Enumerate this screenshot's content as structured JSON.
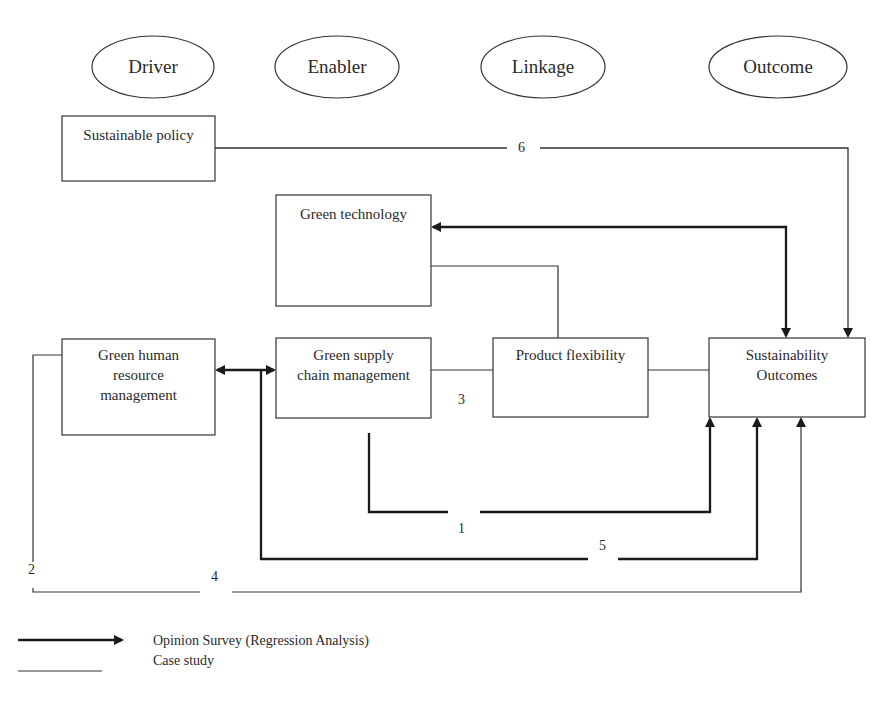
{
  "headers": [
    {
      "id": "driver",
      "label": "Driver"
    },
    {
      "id": "enabler",
      "label": "Enabler"
    },
    {
      "id": "linkage",
      "label": "Linkage"
    },
    {
      "id": "outcome",
      "label": "Outcome"
    }
  ],
  "nodes": {
    "sustainable_policy": "Sustainable policy",
    "green_technology": "Green technology",
    "green_hrm": "Green human resource management",
    "gscm": "Green supply chain management",
    "product_flexibility": "Product flexibility",
    "sustainability_outcomes": "Sustainability Outcomes"
  },
  "path_labels": {
    "p1": "1",
    "p2": "2",
    "p3": "3",
    "p4": "4",
    "p5": "5",
    "p6": "6"
  },
  "legend": {
    "arrow_label": "Opinion Survey (Regression Analysis)",
    "line_label": "Case study"
  },
  "colors": {
    "line": "#2a2a2a",
    "background": "#ffffff"
  }
}
